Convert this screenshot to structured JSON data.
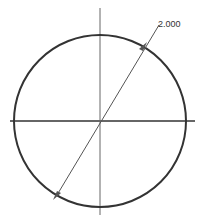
{
  "drawing": {
    "dimension_label": "2.000",
    "dimension_type": "diameter",
    "colors": {
      "circle": "#333333",
      "centerline": "#555555",
      "dimension": "#555555",
      "background": "#ffffff"
    }
  }
}
